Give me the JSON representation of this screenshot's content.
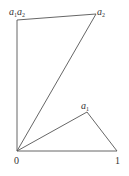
{
  "diagram": {
    "line_color": "#555555",
    "points": {
      "origin": {
        "label": "0",
        "x": 17,
        "y": 151
      },
      "one": {
        "label": "1",
        "x": 117,
        "y": 151
      },
      "a1": {
        "label_base": "a",
        "label_sub": "1",
        "x": 87,
        "y": 112
      },
      "a2": {
        "label_base": "a",
        "label_sub": "2",
        "x": 96,
        "y": 14
      },
      "a1a2": {
        "label_base1": "a",
        "label_sub1": "1",
        "label_base2": "a",
        "label_sub2": "2",
        "x": 17,
        "y": 20
      }
    }
  }
}
